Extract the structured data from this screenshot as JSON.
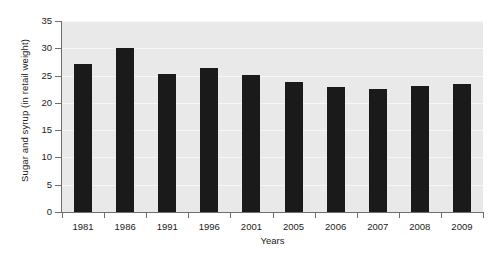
{
  "chart_data": {
    "type": "bar",
    "title": "",
    "xlabel": "Years",
    "ylabel": "Sugar and syrup (in retail weight)",
    "categories": [
      "1981",
      "1986",
      "1991",
      "1996",
      "2001",
      "2005",
      "2006",
      "2007",
      "2008",
      "2009"
    ],
    "values": [
      27.2,
      30.0,
      25.3,
      26.4,
      25.1,
      23.8,
      22.9,
      22.5,
      23.1,
      23.5
    ],
    "ylim": [
      0,
      35
    ],
    "yticks": [
      0,
      5,
      10,
      15,
      20,
      25,
      30,
      35
    ],
    "ytick_labels": [
      "0",
      "5",
      "10",
      "15",
      "20",
      "25",
      "30",
      "35"
    ],
    "grid": true,
    "legend": false,
    "bar_color": "#1a1a1a",
    "plot_background": "#e9e9e9",
    "figure_background": "#ffffff",
    "axis_color": "#6d6d6d",
    "gridline_color": "#f7f7f7"
  }
}
